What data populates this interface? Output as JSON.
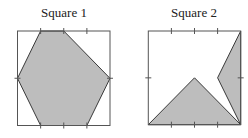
{
  "figures": [
    {
      "title": "Square 1",
      "frame": {
        "x": 17.5,
        "y": 31,
        "w": 92.5,
        "h": 94.5
      },
      "shaded_shapes": [
        {
          "name": "hexagon",
          "points": [
            [
              0.25,
              0
            ],
            [
              0.5,
              0
            ],
            [
              1,
              0.5
            ],
            [
              0.75,
              1
            ],
            [
              0.25,
              1
            ],
            [
              0,
              0.5
            ]
          ]
        }
      ],
      "ticks": {
        "top": [
          0.25,
          0.5,
          0.75
        ],
        "bottom": [
          0.25,
          0.5,
          0.75
        ],
        "left": [
          0.5
        ],
        "right": [
          0.5
        ]
      }
    },
    {
      "title": "Square 2",
      "frame": {
        "x": 148.3,
        "y": 31,
        "w": 92.4,
        "h": 93.7
      },
      "shaded_shapes": [
        {
          "name": "triangle",
          "points": [
            [
              0,
              1
            ],
            [
              0.5,
              0.5
            ],
            [
              1,
              1
            ]
          ]
        },
        {
          "name": "right-wedge",
          "points": [
            [
              1,
              0
            ],
            [
              0.75,
              0.5
            ],
            [
              1,
              1
            ]
          ]
        }
      ],
      "ticks": {
        "top": [
          0.25,
          0.5,
          0.75
        ],
        "bottom": [
          0.25,
          0.5,
          0.75
        ],
        "left": [
          0.5
        ],
        "right": [
          0.5
        ]
      }
    }
  ],
  "colors": {
    "fill": "#bdbdbd",
    "stroke": "#3a3a3a",
    "frame": "#555555"
  }
}
